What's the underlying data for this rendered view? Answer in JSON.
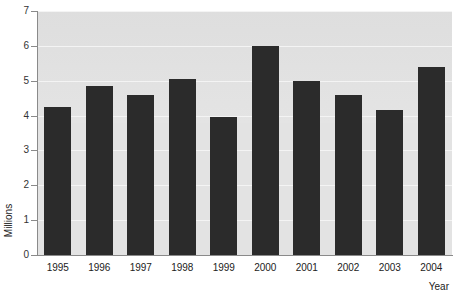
{
  "chart_data": {
    "type": "bar",
    "title": "1995-2004",
    "title_clipped": true,
    "xlabel": "Year",
    "ylabel": "Millions",
    "categories": [
      "1995",
      "1996",
      "1997",
      "1998",
      "1999",
      "2000",
      "2001",
      "2002",
      "2003",
      "2004"
    ],
    "values": [
      4.25,
      4.85,
      4.6,
      5.05,
      3.95,
      6.0,
      5.0,
      4.6,
      4.15,
      5.4
    ],
    "ylim": [
      0,
      7
    ],
    "ytick_labels": [
      "7",
      "6",
      "5",
      "4",
      "3",
      "2",
      "1",
      "0"
    ],
    "ytick_values": [
      7,
      6,
      5,
      4,
      3,
      2,
      1,
      0
    ],
    "grid": true,
    "legend": false,
    "bar_color": "#2b2b2b",
    "plot_background": "#e3e3e3",
    "gridline_color": "#f4f4f4",
    "axis_color": "#8a8a8a"
  }
}
